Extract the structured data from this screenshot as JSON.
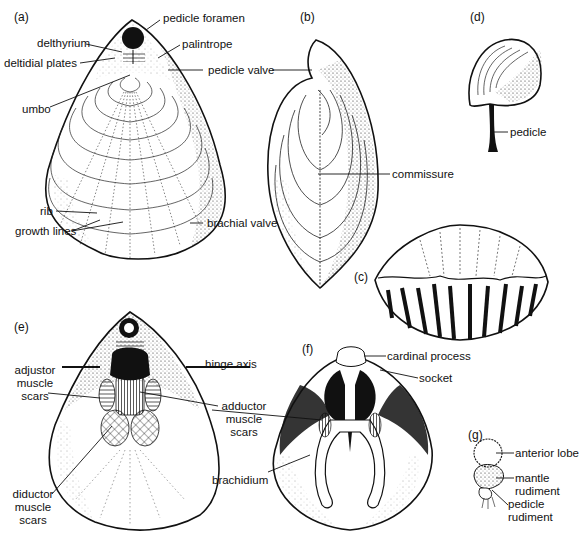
{
  "figure": {
    "panels": {
      "a": {
        "tag": "(a)",
        "labels": {
          "pedicle_foramen": "pedicle foramen",
          "delthyrium": "delthyrium",
          "palintrope": "palintrope",
          "deltidial_plates": "deltidial plates",
          "pedicle_valve": "pedicle valve",
          "umbo": "umbo",
          "rib": "rib",
          "growth_lines": "growth lines",
          "brachial_valve": "brachial valve"
        }
      },
      "b": {
        "tag": "(b)",
        "labels": {
          "commissure": "commissure"
        }
      },
      "c": {
        "tag": "(c)"
      },
      "d": {
        "tag": "(d)",
        "labels": {
          "pedicle": "pedicle"
        }
      },
      "e": {
        "tag": "(e)",
        "labels": {
          "adjustor_muscle_scars": [
            "adjustor",
            "muscle",
            "scars"
          ],
          "hinge_axis": "hinge axis",
          "adductor_muscle_scars": [
            "adductor",
            "muscle",
            "scars"
          ],
          "diductor_muscle_scars": [
            "diductor",
            "muscle",
            "scars"
          ]
        }
      },
      "f": {
        "tag": "(f)",
        "labels": {
          "cardinal_process": "cardinal process",
          "socket": "socket",
          "brachidium": "brachidium"
        }
      },
      "g": {
        "tag": "(g)",
        "labels": {
          "anterior_lobe": "anterior lobe",
          "mantle_rudiment": [
            "mantle",
            "rudiment"
          ],
          "pedicle_rudiment": [
            "pedicle",
            "rudiment"
          ]
        }
      }
    },
    "colors": {
      "ink": "#111111",
      "paper": "#ffffff"
    }
  }
}
